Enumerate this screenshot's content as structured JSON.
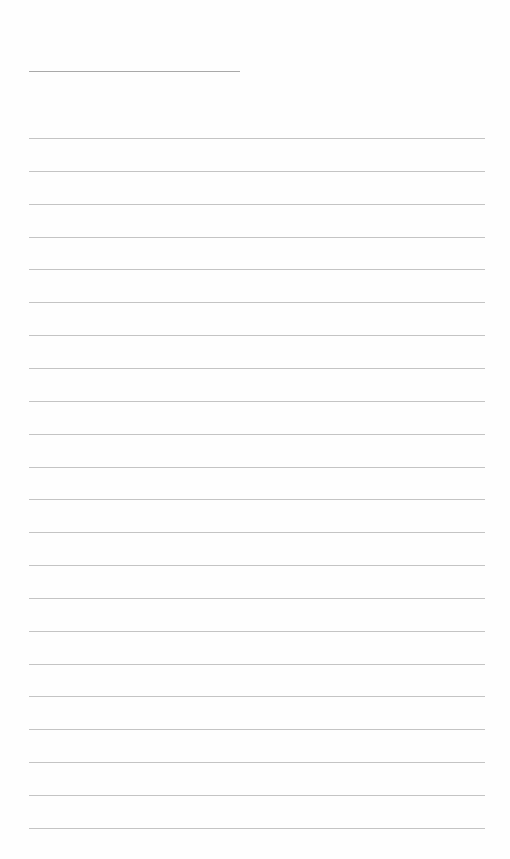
{
  "page": {
    "type": "lined-paper",
    "header_line": {
      "x": 29,
      "y": 71,
      "width": 211,
      "color": "#a9a9a9"
    },
    "rules": {
      "count": 22,
      "x": 29,
      "width": 456,
      "first_y": 138,
      "spacing": 32.85,
      "color": "#c4c4c4"
    }
  }
}
